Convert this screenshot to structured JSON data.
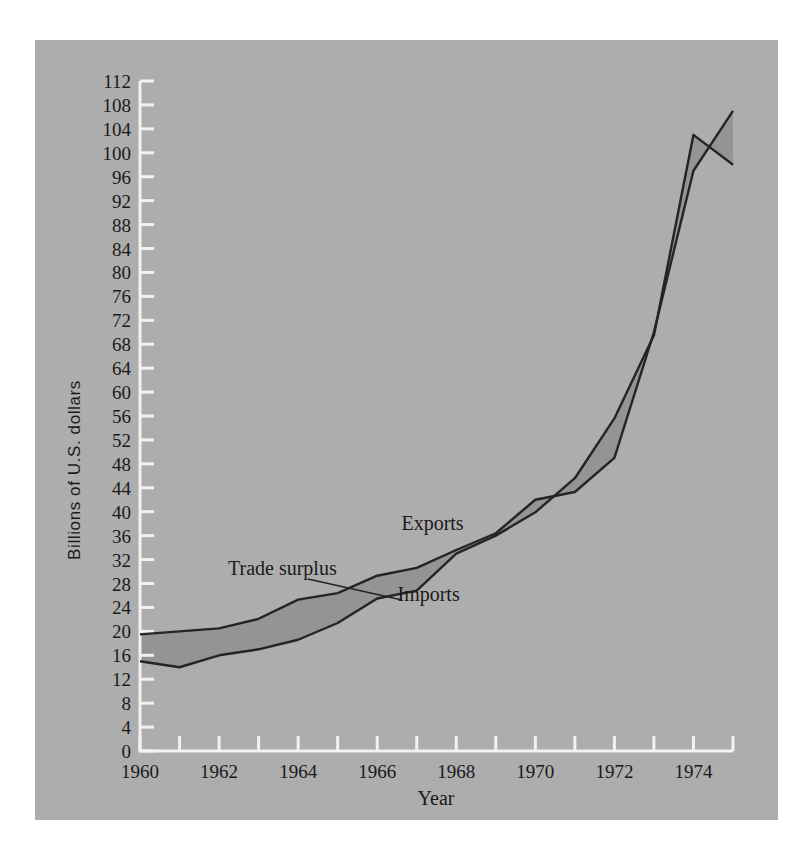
{
  "figure": {
    "panel_color": "#adadad",
    "axis_color": "#f2f2f2",
    "line_color": "#242424",
    "band_color": "#949494"
  },
  "labels": {
    "y_axis_title": "Billions of U.S. dollars",
    "x_axis_title": "Year",
    "exports": "Exports",
    "imports": "Imports",
    "trade_surplus": "Trade surplus"
  },
  "chart_data": {
    "type": "line",
    "title": "",
    "subtitle": "",
    "xlabel": "Year",
    "ylabel": "Billions of U.S. dollars",
    "xlim": [
      1960,
      1975
    ],
    "ylim": [
      0,
      112
    ],
    "grid": false,
    "legend": "inline-annotations",
    "annotations": [
      {
        "text": "Exports",
        "x": 1967.4,
        "y": 37
      },
      {
        "text": "Imports",
        "x": 1967.3,
        "y": 25
      },
      {
        "text": "Trade surplus",
        "x": 1963.6,
        "y": 29.5
      }
    ],
    "x": [
      1960,
      1961,
      1962,
      1963,
      1964,
      1965,
      1966,
      1967,
      1968,
      1969,
      1970,
      1971,
      1972,
      1973,
      1974,
      1975
    ],
    "series": [
      {
        "name": "Exports",
        "values": [
          19.5,
          20.0,
          20.5,
          22.1,
          25.3,
          26.4,
          29.3,
          30.6,
          33.6,
          36.4,
          42.0,
          43.3,
          49.0,
          70.0,
          97.0,
          107.0
        ]
      },
      {
        "name": "Imports",
        "values": [
          15.0,
          14.0,
          16.0,
          17.0,
          18.6,
          21.4,
          25.5,
          26.8,
          33.0,
          36.0,
          39.9,
          45.6,
          55.6,
          69.5,
          103.0,
          98.0
        ]
      }
    ],
    "y_ticks": [
      0,
      4,
      8,
      12,
      16,
      20,
      24,
      28,
      32,
      36,
      40,
      44,
      48,
      52,
      56,
      60,
      64,
      68,
      72,
      76,
      80,
      84,
      88,
      92,
      96,
      100,
      104,
      108,
      112
    ],
    "x_ticks": [
      1960,
      1961,
      1962,
      1963,
      1964,
      1965,
      1966,
      1967,
      1968,
      1969,
      1970,
      1971,
      1972,
      1973,
      1974,
      1975
    ],
    "x_tick_labels": [
      {
        "value": 1960,
        "label": "1960"
      },
      {
        "value": 1962,
        "label": "1962"
      },
      {
        "value": 1964,
        "label": "1964"
      },
      {
        "value": 1966,
        "label": "1966"
      },
      {
        "value": 1968,
        "label": "1968"
      },
      {
        "value": 1970,
        "label": "1970"
      },
      {
        "value": 1972,
        "label": "1972"
      },
      {
        "value": 1974,
        "label": "1974"
      }
    ]
  }
}
